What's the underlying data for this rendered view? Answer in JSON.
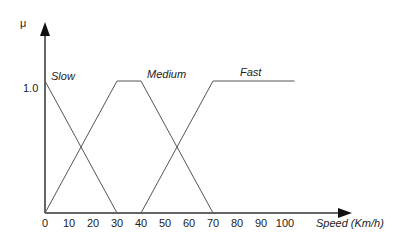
{
  "chart_data": {
    "type": "line",
    "title": "",
    "xlabel": "Speed (Km/h)",
    "ylabel": "μ",
    "xlim": [
      0,
      110
    ],
    "ylim": [
      0,
      1.0
    ],
    "x_ticks": [
      "0",
      "10",
      "20",
      "30",
      "40",
      "50",
      "60",
      "70",
      "80",
      "90",
      "100"
    ],
    "y_ticks": [
      "1.0"
    ],
    "grid": false,
    "series": [
      {
        "name": "Slow",
        "x": [
          0,
          30
        ],
        "y": [
          1.0,
          0
        ]
      },
      {
        "name": "Medium",
        "x": [
          0,
          30,
          40,
          70
        ],
        "y": [
          0,
          1.0,
          1.0,
          0
        ]
      },
      {
        "name": "Fast",
        "x": [
          40,
          70,
          104
        ],
        "y": [
          0,
          1.0,
          1.0
        ]
      }
    ]
  },
  "labels": {
    "y_axis": "μ",
    "x_axis": "Speed (Km/h)",
    "y_one": "1.0",
    "slow": "Slow",
    "medium": "Medium",
    "fast": "Fast"
  }
}
